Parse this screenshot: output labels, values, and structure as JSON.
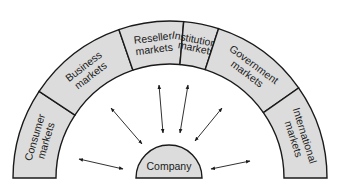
{
  "diagram": {
    "center": {
      "label": "Company"
    },
    "segments": [
      {
        "id": "consumer",
        "line1": "Consumer",
        "line2": "markets"
      },
      {
        "id": "business",
        "line1": "Business",
        "line2": "markets"
      },
      {
        "id": "reseller",
        "line1": "Reseller",
        "line2": "markets"
      },
      {
        "id": "institutional",
        "line1": "Institutional",
        "line2": "markets"
      },
      {
        "id": "government",
        "line1": "Government",
        "line2": "markets"
      },
      {
        "id": "international",
        "line1": "International",
        "line2": "markets"
      }
    ],
    "colors": {
      "segment_fill": "#dcdcdc",
      "stroke": "#1a1a1a",
      "background": "#ffffff"
    }
  }
}
